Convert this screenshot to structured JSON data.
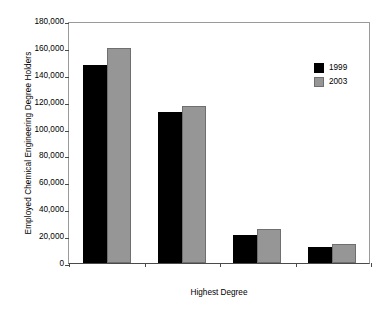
{
  "chart_data": {
    "type": "bar",
    "title": "",
    "subtitle": "",
    "xlabel": "Highest Degree",
    "ylabel": "Employed Chemical Engineering Degree Holders",
    "categories": [
      "Total",
      "Bachelor's",
      "Master's",
      "PhD"
    ],
    "series": [
      {
        "name": "1999",
        "color": "#000000",
        "values": [
          147000,
          112000,
          20500,
          12000
        ]
      },
      {
        "name": "2003",
        "color": "#969696",
        "values": [
          160000,
          116500,
          25500,
          14500
        ]
      }
    ],
    "ylim": [
      0,
      180000
    ],
    "ytick_values": [
      0,
      20000,
      40000,
      60000,
      80000,
      100000,
      120000,
      140000,
      160000,
      180000
    ],
    "ytick_labels": [
      "0",
      "20,000",
      "40,000",
      "60,000",
      "80,000",
      "100,000",
      "120,000",
      "140,000",
      "160,000",
      "180,000"
    ],
    "grid": false,
    "legend_position": "upper-right-inside",
    "legend_entries": [
      "1999",
      "2003"
    ],
    "annotations": []
  }
}
